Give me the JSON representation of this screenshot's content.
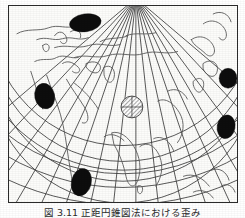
{
  "figure": {
    "caption": "図 3.11  正距円錐図法における歪み",
    "frame": {
      "x": 8,
      "y": 5,
      "width": 230,
      "height": 198
    },
    "background_color": "#fcfcfa",
    "border_color": "#2b2b2b"
  },
  "map": {
    "projection_type": "conic",
    "apex": {
      "x": 136,
      "y": -3
    },
    "graticule": {
      "line_color": "#3a3a3a",
      "meridian_count": 17,
      "parallel_count": 9,
      "meridian_spacing_deg": 15,
      "parallel_spacing_deg": 15
    },
    "coastline_color": "#555555"
  },
  "indicatrices": {
    "legend_note": "Tissot indicatrix ellipses",
    "distortion_color": "#0d0d0d",
    "standard_color": "#8a8a8a",
    "ellipses": [
      {
        "name": "indicatrix-north-polar",
        "cx": 85,
        "cy": 22,
        "rx": 16,
        "ry": 9,
        "rot": -8,
        "fill": "solid"
      },
      {
        "name": "indicatrix-west-mid",
        "cx": 44,
        "cy": 96,
        "rx": 10,
        "ry": 13,
        "rot": -12,
        "fill": "solid"
      },
      {
        "name": "indicatrix-east-upper",
        "cx": 229,
        "cy": 78,
        "rx": 9,
        "ry": 10,
        "rot": 0,
        "fill": "solid"
      },
      {
        "name": "indicatrix-east-lower",
        "cx": 227,
        "cy": 127,
        "rx": 9,
        "ry": 12,
        "rot": 10,
        "fill": "solid"
      },
      {
        "name": "indicatrix-southwest",
        "cx": 81,
        "cy": 183,
        "rx": 10,
        "ry": 14,
        "rot": 14,
        "fill": "solid"
      },
      {
        "name": "indicatrix-standard-center",
        "cx": 132,
        "cy": 107,
        "rx": 11,
        "ry": 11,
        "rot": 0,
        "fill": "hatched"
      }
    ]
  }
}
